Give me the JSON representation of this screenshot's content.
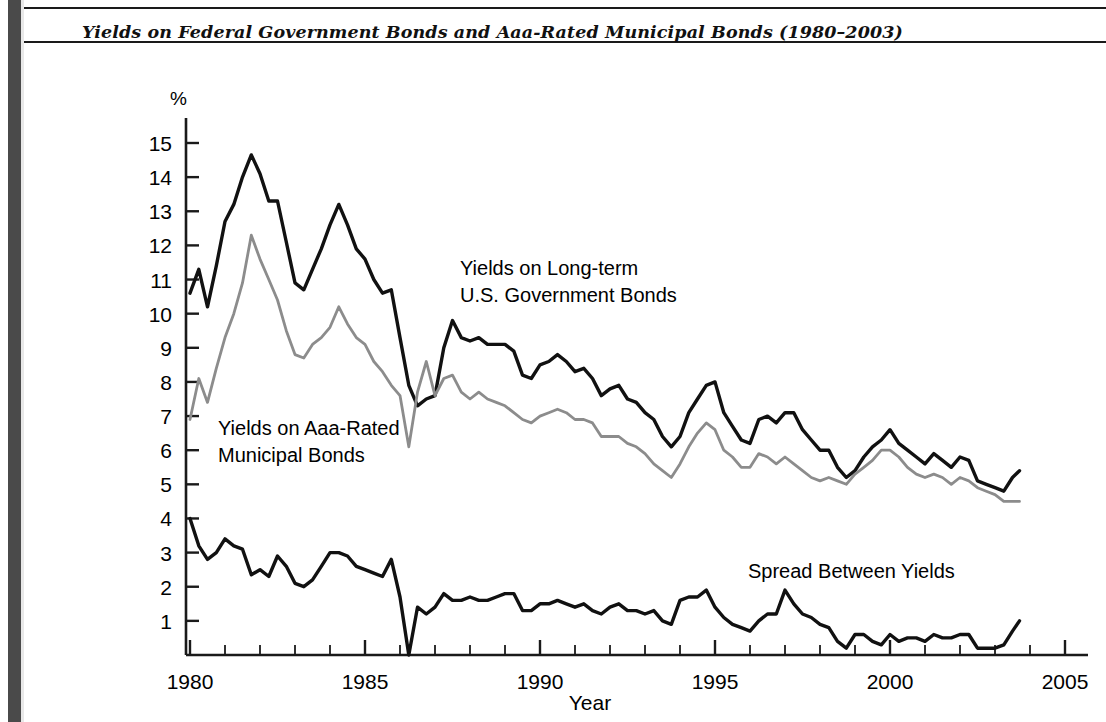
{
  "figure": {
    "title": "Yields on Federal Government Bonds and Aaa-Rated Municipal Bonds (1980–2003)",
    "unit_label": "%",
    "xlabel": "Year"
  },
  "colors": {
    "government_line": "#111111",
    "municipal_line": "#8c8c8c",
    "spread_line": "#111111",
    "axis": "#1a1a1a",
    "gutter": "#4a4a4a"
  },
  "annotations": [
    {
      "id": "gov-annotation",
      "lines": [
        "Yields on Long-term",
        "U.S. Government Bonds"
      ],
      "x": 460,
      "y": 275
    },
    {
      "id": "muni-annotation",
      "lines": [
        "Yields on Aaa-Rated",
        "Municipal Bonds"
      ],
      "x": 218,
      "y": 435
    },
    {
      "id": "spread-annotation",
      "lines": [
        "Spread Between Yields"
      ],
      "x": 748,
      "y": 578
    }
  ],
  "chart_data": {
    "type": "line",
    "title": "Yields on Federal Government Bonds and Aaa-Rated Municipal Bonds (1980–2003)",
    "xlabel": "Year",
    "ylabel": "%",
    "xlim": [
      1980,
      2005
    ],
    "ylim": [
      0,
      15.6
    ],
    "grid": false,
    "legend": "inline-annotations",
    "xticks": [
      1980,
      1985,
      1990,
      1995,
      2000,
      2005
    ],
    "xticks_minor_step": 1,
    "yticks": [
      1,
      2,
      3,
      4,
      5,
      6,
      7,
      8,
      9,
      10,
      11,
      12,
      13,
      14,
      15
    ],
    "x": [
      1980.0,
      1980.25,
      1980.5,
      1980.75,
      1981.0,
      1981.25,
      1981.5,
      1981.75,
      1982.0,
      1982.25,
      1982.5,
      1982.75,
      1983.0,
      1983.25,
      1983.5,
      1983.75,
      1984.0,
      1984.25,
      1984.5,
      1984.75,
      1985.0,
      1985.25,
      1985.5,
      1985.75,
      1986.0,
      1986.25,
      1986.5,
      1986.75,
      1987.0,
      1987.25,
      1987.5,
      1987.75,
      1988.0,
      1988.25,
      1988.5,
      1988.75,
      1989.0,
      1989.25,
      1989.5,
      1989.75,
      1990.0,
      1990.25,
      1990.5,
      1990.75,
      1991.0,
      1991.25,
      1991.5,
      1991.75,
      1992.0,
      1992.25,
      1992.5,
      1992.75,
      1993.0,
      1993.25,
      1993.5,
      1993.75,
      1994.0,
      1994.25,
      1994.5,
      1994.75,
      1995.0,
      1995.25,
      1995.5,
      1995.75,
      1996.0,
      1996.25,
      1996.5,
      1996.75,
      1997.0,
      1997.25,
      1997.5,
      1997.75,
      1998.0,
      1998.25,
      1998.5,
      1998.75,
      1999.0,
      1999.25,
      1999.5,
      1999.75,
      2000.0,
      2000.25,
      2000.5,
      2000.75,
      2001.0,
      2001.25,
      2001.5,
      2001.75,
      2002.0,
      2002.25,
      2002.5,
      2002.75,
      2003.0,
      2003.25,
      2003.5,
      2003.7
    ],
    "series": [
      {
        "name": "Yields on Long-term U.S. Government Bonds",
        "color": "#111111",
        "values": [
          10.6,
          11.3,
          10.2,
          11.4,
          12.7,
          13.2,
          14.0,
          14.65,
          14.1,
          13.3,
          13.3,
          12.1,
          10.9,
          10.7,
          11.3,
          11.9,
          12.6,
          13.2,
          12.6,
          11.9,
          11.6,
          11.0,
          10.6,
          10.7,
          9.3,
          7.9,
          7.3,
          7.5,
          7.6,
          9.0,
          9.8,
          9.3,
          9.2,
          9.3,
          9.1,
          9.1,
          9.1,
          8.9,
          8.2,
          8.1,
          8.5,
          8.6,
          8.8,
          8.6,
          8.3,
          8.4,
          8.1,
          7.6,
          7.8,
          7.9,
          7.5,
          7.4,
          7.1,
          6.9,
          6.4,
          6.1,
          6.4,
          7.1,
          7.5,
          7.9,
          8.0,
          7.1,
          6.7,
          6.3,
          6.2,
          6.9,
          7.0,
          6.8,
          7.1,
          7.1,
          6.6,
          6.3,
          6.0,
          6.0,
          5.5,
          5.2,
          5.4,
          5.8,
          6.1,
          6.3,
          6.6,
          6.2,
          6.0,
          5.8,
          5.6,
          5.9,
          5.7,
          5.5,
          5.8,
          5.7,
          5.1,
          5.0,
          4.9,
          4.8,
          5.2,
          5.4
        ]
      },
      {
        "name": "Yields on Aaa-Rated Municipal Bonds",
        "color": "#8c8c8c",
        "values": [
          6.9,
          8.1,
          7.4,
          8.4,
          9.3,
          10.0,
          10.9,
          12.3,
          11.6,
          11.0,
          10.4,
          9.5,
          8.8,
          8.7,
          9.1,
          9.3,
          9.6,
          10.2,
          9.7,
          9.3,
          9.1,
          8.6,
          8.3,
          7.9,
          7.6,
          6.1,
          7.7,
          8.6,
          7.6,
          8.1,
          8.2,
          7.7,
          7.5,
          7.7,
          7.5,
          7.4,
          7.3,
          7.1,
          6.9,
          6.8,
          7.0,
          7.1,
          7.2,
          7.1,
          6.9,
          6.9,
          6.8,
          6.4,
          6.4,
          6.4,
          6.2,
          6.1,
          5.9,
          5.6,
          5.4,
          5.2,
          5.6,
          6.1,
          6.5,
          6.8,
          6.6,
          6.0,
          5.8,
          5.5,
          5.5,
          5.9,
          5.8,
          5.6,
          5.8,
          5.6,
          5.4,
          5.2,
          5.1,
          5.2,
          5.1,
          5.0,
          5.3,
          5.5,
          5.7,
          6.0,
          6.0,
          5.8,
          5.5,
          5.3,
          5.2,
          5.3,
          5.2,
          5.0,
          5.2,
          5.1,
          4.9,
          4.8,
          4.7,
          4.5,
          4.5,
          4.5
        ]
      },
      {
        "name": "Spread Between Yields",
        "color": "#111111",
        "values": [
          4.0,
          3.2,
          2.8,
          3.0,
          3.4,
          3.2,
          3.1,
          2.35,
          2.5,
          2.3,
          2.9,
          2.6,
          2.1,
          2.0,
          2.2,
          2.6,
          3.0,
          3.0,
          2.9,
          2.6,
          2.5,
          2.4,
          2.3,
          2.8,
          1.7,
          0.0,
          1.4,
          1.2,
          1.4,
          1.8,
          1.6,
          1.6,
          1.7,
          1.6,
          1.6,
          1.7,
          1.8,
          1.8,
          1.3,
          1.3,
          1.5,
          1.5,
          1.6,
          1.5,
          1.4,
          1.5,
          1.3,
          1.2,
          1.4,
          1.5,
          1.3,
          1.3,
          1.2,
          1.3,
          1.0,
          0.9,
          1.6,
          1.7,
          1.7,
          1.9,
          1.4,
          1.1,
          0.9,
          0.8,
          0.7,
          1.0,
          1.2,
          1.2,
          1.9,
          1.5,
          1.2,
          1.1,
          0.9,
          0.8,
          0.4,
          0.2,
          0.6,
          0.6,
          0.4,
          0.3,
          0.6,
          0.4,
          0.5,
          0.5,
          0.4,
          0.6,
          0.5,
          0.5,
          0.6,
          0.6,
          0.2,
          0.2,
          0.2,
          0.3,
          0.7,
          1.0
        ]
      }
    ]
  }
}
